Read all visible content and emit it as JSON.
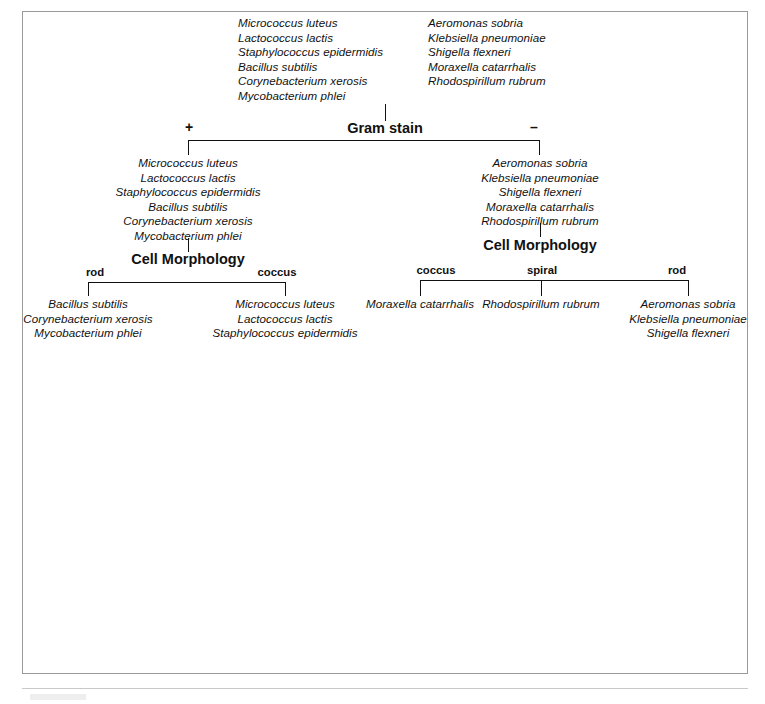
{
  "figure": {
    "type": "dichotomous-key",
    "root": {
      "column_left": [
        "Micrococcus luteus",
        "Lactococcus lactis",
        "Staphylococcus epidermidis",
        "Bacillus subtilis",
        "Corynebacterium xerosis",
        "Mycobacterium phlei"
      ],
      "column_right": [
        "Aeromonas sobria",
        "Klebsiella pneumoniae",
        "Shigella flexneri",
        "Moraxella catarrhalis",
        "Rhodospirillum rubrum"
      ]
    },
    "tests": {
      "gram_stain": "Gram stain",
      "cell_morphology": "Cell Morphology"
    },
    "branch_labels": {
      "gram_positive": "+",
      "gram_negative": "–",
      "rod": "rod",
      "coccus": "coccus",
      "spiral": "spiral"
    },
    "gram_positive_group": [
      "Micrococcus luteus",
      "Lactococcus lactis",
      "Staphylococcus epidermidis",
      "Bacillus subtilis",
      "Corynebacterium xerosis",
      "Mycobacterium phlei"
    ],
    "gram_negative_group": [
      "Aeromonas sobria",
      "Klebsiella pneumoniae",
      "Shigella flexneri",
      "Moraxella catarrhalis",
      "Rhodospirillum rubrum"
    ],
    "terminal_groups": {
      "gram_positive_rod": [
        "Bacillus subtilis",
        "Corynebacterium xerosis",
        "Mycobacterium phlei"
      ],
      "gram_positive_coccus": [
        "Micrococcus luteus",
        "Lactococcus lactis",
        "Staphylococcus epidermidis"
      ],
      "gram_negative_coccus": [
        "Moraxella catarrhalis"
      ],
      "gram_negative_spiral": [
        "Rhodospirillum rubrum"
      ],
      "gram_negative_rod": [
        "Aeromonas sobria",
        "Klebsiella pneumoniae",
        "Shigella flexneri"
      ]
    }
  }
}
